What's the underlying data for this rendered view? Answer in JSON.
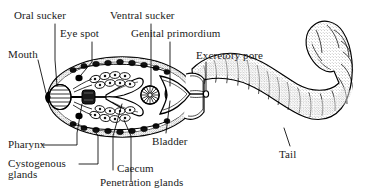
{
  "figure": {
    "background_color": "#ffffff",
    "ink_color": "#000000",
    "width": 371,
    "height": 195
  },
  "labels": {
    "oral_sucker": "Oral sucker",
    "eye_spot": "Eye spot",
    "mouth": "Mouth",
    "ventral_sucker": "Ventral sucker",
    "genital_primordium": "Genital primordium",
    "excretory_pore": "Excretory pore",
    "bladder": "Bladder",
    "tail": "Tail",
    "pharynx": "Pharynx",
    "cystogenous_glands_line1": "Cystogenous",
    "cystogenous_glands_line2": "glands",
    "caecum": "Caecum",
    "penetration_glands": "Penetration glands"
  },
  "parts": [
    {
      "name": "oral-sucker",
      "label": "Oral sucker"
    },
    {
      "name": "eye-spot",
      "label": "Eye spot"
    },
    {
      "name": "mouth",
      "label": "Mouth"
    },
    {
      "name": "ventral-sucker",
      "label": "Ventral sucker"
    },
    {
      "name": "genital-primordium",
      "label": "Genital primordium"
    },
    {
      "name": "excretory-pore",
      "label": "Excretory pore"
    },
    {
      "name": "bladder",
      "label": "Bladder"
    },
    {
      "name": "tail",
      "label": "Tail"
    },
    {
      "name": "pharynx",
      "label": "Pharynx"
    },
    {
      "name": "cystogenous-glands",
      "label": "Cystogenous glands"
    },
    {
      "name": "caecum",
      "label": "Caecum"
    },
    {
      "name": "penetration-glands",
      "label": "Penetration glands"
    }
  ]
}
